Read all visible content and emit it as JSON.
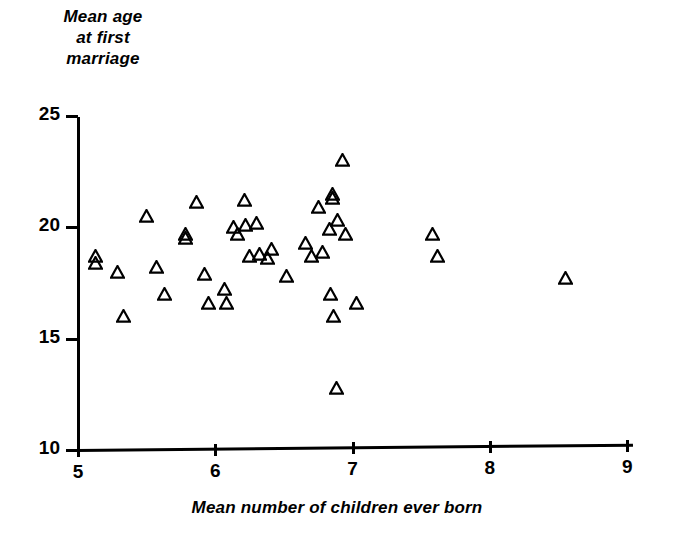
{
  "chart_data": {
    "type": "scatter",
    "title": "",
    "ylabel_lines": [
      "Mean age",
      "at first",
      "marriage"
    ],
    "ylabel": "Mean age at first marriage",
    "xlabel": "Mean number of children ever born",
    "xlim": [
      5,
      9.3
    ],
    "ylim": [
      10,
      25
    ],
    "xticks": [
      5,
      6,
      7,
      8,
      9
    ],
    "xtick_labels": [
      "5",
      "6",
      "7",
      "8",
      "9"
    ],
    "yticks": [
      10,
      15,
      20,
      25
    ],
    "ytick_labels": [
      "10",
      "15",
      "20",
      "25"
    ],
    "grid": false,
    "legend": null,
    "marker": "triangle-open",
    "marker_color": "#000000",
    "n_points": 45,
    "points": [
      {
        "x": 5.13,
        "y": 18.7
      },
      {
        "x": 5.13,
        "y": 18.4
      },
      {
        "x": 5.29,
        "y": 18.0
      },
      {
        "x": 5.33,
        "y": 16.0
      },
      {
        "x": 5.5,
        "y": 20.5
      },
      {
        "x": 5.57,
        "y": 18.2
      },
      {
        "x": 5.63,
        "y": 17.0
      },
      {
        "x": 5.78,
        "y": 19.7
      },
      {
        "x": 5.78,
        "y": 19.5
      },
      {
        "x": 5.86,
        "y": 21.1
      },
      {
        "x": 5.92,
        "y": 17.9
      },
      {
        "x": 5.95,
        "y": 16.6
      },
      {
        "x": 6.07,
        "y": 17.2
      },
      {
        "x": 6.08,
        "y": 16.6
      },
      {
        "x": 6.13,
        "y": 20.0
      },
      {
        "x": 6.16,
        "y": 19.7
      },
      {
        "x": 6.21,
        "y": 21.2
      },
      {
        "x": 6.22,
        "y": 20.1
      },
      {
        "x": 6.25,
        "y": 18.7
      },
      {
        "x": 6.3,
        "y": 20.2
      },
      {
        "x": 6.32,
        "y": 18.8
      },
      {
        "x": 6.38,
        "y": 18.6
      },
      {
        "x": 6.41,
        "y": 19.0
      },
      {
        "x": 6.52,
        "y": 17.8
      },
      {
        "x": 6.66,
        "y": 19.3
      },
      {
        "x": 6.7,
        "y": 18.7
      },
      {
        "x": 6.75,
        "y": 20.9
      },
      {
        "x": 6.78,
        "y": 18.9
      },
      {
        "x": 6.83,
        "y": 19.9
      },
      {
        "x": 6.84,
        "y": 17.0
      },
      {
        "x": 6.85,
        "y": 21.5
      },
      {
        "x": 6.85,
        "y": 21.3
      },
      {
        "x": 6.86,
        "y": 16.0
      },
      {
        "x": 6.88,
        "y": 12.8
      },
      {
        "x": 6.89,
        "y": 20.3
      },
      {
        "x": 6.93,
        "y": 23.0
      },
      {
        "x": 6.95,
        "y": 19.7
      },
      {
        "x": 7.03,
        "y": 16.6
      },
      {
        "x": 7.58,
        "y": 19.7
      },
      {
        "x": 7.62,
        "y": 18.7
      },
      {
        "x": 8.55,
        "y": 17.7
      }
    ]
  },
  "axes": {
    "pixel_mapping": {
      "x0_px": 78,
      "x0_val": 5,
      "px_per_x": 137.3,
      "y0_px": 450,
      "y0_val": 10,
      "px_per_y": 22.3
    }
  }
}
